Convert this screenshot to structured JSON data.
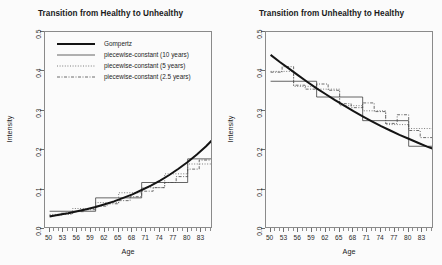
{
  "figure": {
    "width": 442,
    "height": 265,
    "background": "#fbfbfb"
  },
  "legend": {
    "entries": [
      {
        "label": "Gompertz",
        "style": "solid-thick",
        "color": "#141414"
      },
      {
        "label": "piecewise-constant (10 years)",
        "style": "solid-thin",
        "color": "#3a3a3a"
      },
      {
        "label": "piecewise-constant (5 years)",
        "style": "dotted",
        "color": "#5a5a5a"
      },
      {
        "label": "piecewise-constant (2.5 years)",
        "style": "dashdot",
        "color": "#4a4a4a"
      }
    ]
  },
  "chart_data": [
    {
      "type": "line",
      "title": "Transition from Healthy to Unhealthy",
      "xlabel": "Age",
      "ylabel": "Intensity",
      "xlim": [
        49,
        85.5
      ],
      "ylim": [
        0.0,
        0.5
      ],
      "xticks": [
        50,
        53,
        56,
        59,
        62,
        65,
        68,
        71,
        74,
        77,
        80,
        83
      ],
      "yticks": [
        0.0,
        0.1,
        0.2,
        0.3,
        0.4,
        0.5
      ],
      "ytick_labels": [
        "0.0",
        "0.1",
        "0.2",
        "0.3",
        "0.4",
        "0.5"
      ],
      "grid": false,
      "legend_position": "top-left",
      "series": [
        {
          "name": "Gompertz",
          "style": "solid-thick",
          "x": [
            50,
            52,
            54,
            56,
            58,
            60,
            62,
            64,
            66,
            68,
            70,
            72,
            74,
            76,
            78,
            80,
            82,
            84,
            85.5
          ],
          "values": [
            0.032,
            0.036,
            0.04,
            0.045,
            0.05,
            0.056,
            0.063,
            0.07,
            0.079,
            0.088,
            0.099,
            0.11,
            0.123,
            0.137,
            0.153,
            0.17,
            0.189,
            0.21,
            0.228
          ]
        },
        {
          "name": "piecewise-constant (10 years)",
          "style": "solid-thin",
          "breaks": [
            50,
            60,
            70,
            80,
            85.5
          ],
          "values": [
            0.045,
            0.079,
            0.118,
            0.178
          ]
        },
        {
          "name": "piecewise-constant (5 years)",
          "style": "dotted",
          "breaks": [
            50,
            55,
            60,
            65,
            70,
            75,
            80,
            85.5
          ],
          "values": [
            0.037,
            0.052,
            0.067,
            0.092,
            0.105,
            0.14,
            0.165,
            0.215
          ]
        },
        {
          "name": "piecewise-constant (2.5 years)",
          "style": "dashdot",
          "breaks": [
            50,
            52.5,
            55,
            57.5,
            60,
            62.5,
            65,
            67.5,
            70,
            72.5,
            75,
            77.5,
            80,
            82.5,
            85.5
          ],
          "values": [
            0.034,
            0.04,
            0.044,
            0.049,
            0.058,
            0.064,
            0.072,
            0.082,
            0.096,
            0.105,
            0.118,
            0.133,
            0.152,
            0.175,
            0.247
          ]
        }
      ]
    },
    {
      "type": "line",
      "title": "Transition from Unhealthy to Healthy",
      "xlabel": "Age",
      "ylabel": "Intensity",
      "xlim": [
        49,
        85.5
      ],
      "ylim": [
        0.0,
        0.5
      ],
      "xticks": [
        50,
        53,
        56,
        59,
        62,
        65,
        68,
        71,
        74,
        77,
        80,
        83
      ],
      "yticks": [
        0.0,
        0.1,
        0.2,
        0.3,
        0.4,
        0.5
      ],
      "ytick_labels": [
        "0.0",
        "0.1",
        "0.2",
        "0.3",
        "0.4",
        "0.5"
      ],
      "grid": false,
      "legend_position": "none",
      "series": [
        {
          "name": "Gompertz",
          "style": "solid-thick",
          "x": [
            50,
            52,
            54,
            56,
            58,
            60,
            62,
            64,
            66,
            68,
            70,
            72,
            74,
            76,
            78,
            80,
            82,
            84,
            85.5
          ],
          "values": [
            0.442,
            0.424,
            0.407,
            0.39,
            0.373,
            0.357,
            0.342,
            0.327,
            0.313,
            0.299,
            0.286,
            0.273,
            0.261,
            0.25,
            0.239,
            0.229,
            0.219,
            0.209,
            0.203
          ]
        },
        {
          "name": "piecewise-constant (10 years)",
          "style": "solid-thin",
          "breaks": [
            50,
            60,
            70,
            80,
            85.5
          ],
          "values": [
            0.375,
            0.335,
            0.275,
            0.21
          ]
        },
        {
          "name": "piecewise-constant (5 years)",
          "style": "dotted",
          "breaks": [
            50,
            55,
            60,
            65,
            70,
            75,
            80,
            85.5
          ],
          "values": [
            0.4,
            0.362,
            0.355,
            0.313,
            0.3,
            0.265,
            0.255,
            0.197
          ]
        },
        {
          "name": "piecewise-constant (2.5 years)",
          "style": "dashdot",
          "breaks": [
            50,
            52.5,
            55,
            57.5,
            60,
            62.5,
            65,
            67.5,
            70,
            72.5,
            75,
            77.5,
            80,
            82.5,
            85.5
          ],
          "values": [
            0.398,
            0.412,
            0.365,
            0.355,
            0.368,
            0.352,
            0.318,
            0.308,
            0.32,
            0.298,
            0.268,
            0.29,
            0.25,
            0.232,
            0.197
          ]
        }
      ]
    }
  ]
}
